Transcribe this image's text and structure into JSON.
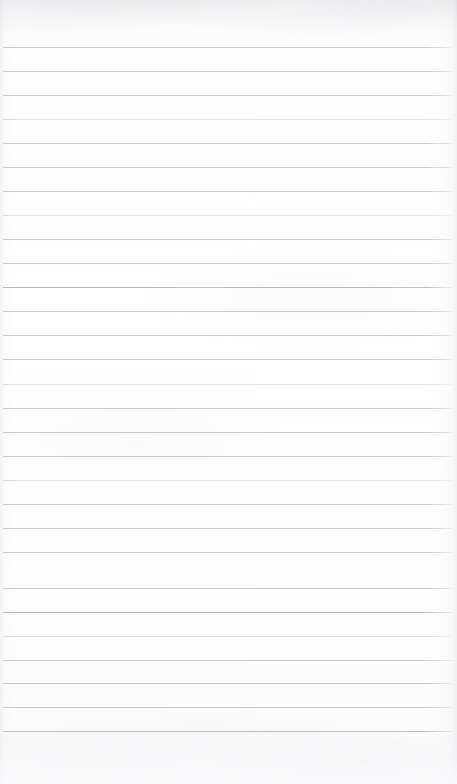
{
  "document": {
    "kind": "scanned-blank-ruled-notebook-page",
    "page_width": 457,
    "page_height": 784,
    "text_content": "",
    "handwriting": "",
    "printed_text": "",
    "visible_labels": [],
    "page_number": "",
    "header_text": "",
    "footer_text": ""
  },
  "paper": {
    "background_color": "#fdfdfe",
    "top_band_color": "#fafafb",
    "bottom_band_color": "#fbfbfc",
    "edge_shadow_color": "#96969e"
  },
  "ruling": {
    "style": "horizontal-ruled",
    "line_color": "#c3c4c9",
    "line_color_strong": "#b9bac0",
    "line_thickness_px": 1,
    "line_spacing_px": 24,
    "first_line_y": 47,
    "last_line_y": 731,
    "line_count": 29,
    "margin_left_px": 3,
    "margin_right_px": 6,
    "left_vertical_margin_rule": false,
    "top_blank_height_px": 47,
    "bottom_blank_height_px": 53,
    "lines": [
      {
        "y": 47,
        "x1": 3,
        "x2": 451,
        "weight": "normal"
      },
      {
        "y": 71,
        "x1": 3,
        "x2": 452,
        "weight": "normal"
      },
      {
        "y": 95,
        "x1": 3,
        "x2": 452,
        "weight": "normal"
      },
      {
        "y": 119,
        "x1": 3,
        "x2": 452,
        "weight": "faint"
      },
      {
        "y": 143,
        "x1": 3,
        "x2": 452,
        "weight": "normal"
      },
      {
        "y": 167,
        "x1": 3,
        "x2": 452,
        "weight": "normal"
      },
      {
        "y": 191,
        "x1": 3,
        "x2": 452,
        "weight": "normal"
      },
      {
        "y": 215,
        "x1": 3,
        "x2": 452,
        "weight": "faint"
      },
      {
        "y": 239,
        "x1": 3,
        "x2": 452,
        "weight": "normal"
      },
      {
        "y": 263,
        "x1": 3,
        "x2": 452,
        "weight": "normal"
      },
      {
        "y": 287,
        "x1": 3,
        "x2": 452,
        "weight": "strong"
      },
      {
        "y": 311,
        "x1": 3,
        "x2": 452,
        "weight": "normal"
      },
      {
        "y": 335,
        "x1": 3,
        "x2": 452,
        "weight": "normal"
      },
      {
        "y": 359,
        "x1": 3,
        "x2": 452,
        "weight": "normal"
      },
      {
        "y": 384,
        "x1": 3,
        "x2": 452,
        "weight": "faint"
      },
      {
        "y": 408,
        "x1": 3,
        "x2": 452,
        "weight": "normal"
      },
      {
        "y": 432,
        "x1": 3,
        "x2": 452,
        "weight": "normal"
      },
      {
        "y": 456,
        "x1": 3,
        "x2": 452,
        "weight": "normal"
      },
      {
        "y": 480,
        "x1": 3,
        "x2": 452,
        "weight": "faint"
      },
      {
        "y": 504,
        "x1": 3,
        "x2": 452,
        "weight": "normal"
      },
      {
        "y": 528,
        "x1": 3,
        "x2": 452,
        "weight": "normal"
      },
      {
        "y": 552,
        "x1": 3,
        "x2": 452,
        "weight": "normal"
      },
      {
        "y": 588,
        "x1": 3,
        "x2": 452,
        "weight": "normal"
      },
      {
        "y": 612,
        "x1": 3,
        "x2": 452,
        "weight": "strong"
      },
      {
        "y": 636,
        "x1": 3,
        "x2": 452,
        "weight": "faint"
      },
      {
        "y": 660,
        "x1": 3,
        "x2": 452,
        "weight": "normal"
      },
      {
        "y": 683,
        "x1": 3,
        "x2": 452,
        "weight": "normal"
      },
      {
        "y": 707,
        "x1": 3,
        "x2": 452,
        "weight": "normal"
      },
      {
        "y": 731,
        "x1": 3,
        "x2": 452,
        "weight": "strong"
      }
    ]
  }
}
